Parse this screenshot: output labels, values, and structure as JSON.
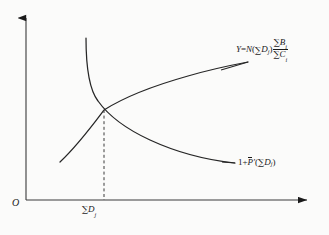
{
  "figure": {
    "background_color": "#fbfbfa",
    "ink_color": "#1a1a1a",
    "origin_label": "O",
    "x_tick_label_parts": {
      "sigma": "∑",
      "base": "D",
      "sub": "j"
    }
  },
  "labels": {
    "upper_curve": {
      "lead": "Y",
      "equals": "=",
      "fn": "N",
      "open": "(",
      "sigma1": "∑",
      "d": "D",
      "d_sub": "j",
      "close": ")",
      "num_sigma": "∑",
      "num_base": "B",
      "num_sub": "i",
      "den_sigma": "∑",
      "den_base": "C",
      "den_sub": "i",
      "full_text": "Y=N(∑Dj)∑Bi/∑Ci"
    },
    "lower_curve": {
      "one_plus": "1+",
      "p": "P",
      "prime": "′",
      "open": "(",
      "sigma": "∑",
      "d": "D",
      "d_sub": "j",
      "close": ")",
      "full_text": "1+P̄′(∑Dj)"
    }
  },
  "chart_data": {
    "type": "line",
    "title": "",
    "xlabel": "",
    "ylabel": "",
    "grid": false,
    "legend": "inline-curve-labels",
    "axes": {
      "x_axis": {
        "y": 200,
        "x_start": 26,
        "x_end": 315,
        "arrow": "right"
      },
      "y_axis": {
        "x": 26,
        "y_start": 200,
        "y_end": 12,
        "arrow": "up"
      }
    },
    "annotations": [
      {
        "name": "equilibrium-dashed-line",
        "type": "vertical-dashed",
        "x": 104,
        "y_top": 110,
        "y_bottom": 200
      },
      {
        "name": "equilibrium-point",
        "x": 104,
        "y": 110,
        "label": "∑Dj"
      }
    ],
    "series": [
      {
        "name": "Y=N(∑Dj)∑Bi/∑Ci",
        "shape": "increasing-concave",
        "label_text": "Y=N(∑Dj)∑Bi/∑Ci",
        "points": [
          [
            60,
            162
          ],
          [
            70,
            152
          ],
          [
            82,
            140
          ],
          [
            92,
            130
          ],
          [
            104,
            110
          ],
          [
            118,
            103
          ],
          [
            134,
            95
          ],
          [
            152,
            88
          ],
          [
            172,
            81
          ],
          [
            194,
            74
          ],
          [
            218,
            68
          ],
          [
            248,
            62
          ]
        ],
        "path": "M 60 162 C 78 145 92 126 104 110 C 126 96 156 85 188 76 C 212 69 232 65 248 62"
      },
      {
        "name": "1+P̄′(∑Dj)",
        "shape": "decreasing-convex",
        "label_text": "1+P̄′(∑Dj)",
        "points": [
          [
            86,
            38
          ],
          [
            87,
            55
          ],
          [
            89,
            72
          ],
          [
            93,
            88
          ],
          [
            98,
            100
          ],
          [
            104,
            110
          ],
          [
            118,
            124
          ],
          [
            136,
            135
          ],
          [
            158,
            145
          ],
          [
            182,
            153
          ],
          [
            208,
            159
          ],
          [
            235,
            163
          ]
        ],
        "path": "M 86 38 C 86 62 88 88 98 101 C 108 115 124 128 150 140 C 176 152 206 160 235 163"
      }
    ]
  }
}
